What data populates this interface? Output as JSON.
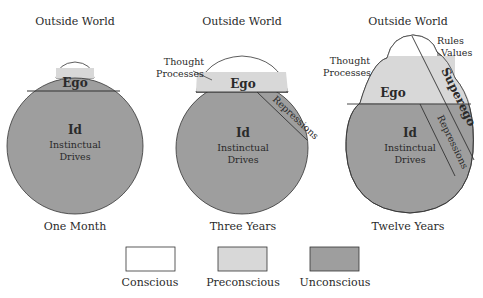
{
  "colors": {
    "conscious": "#ffffff",
    "preconscious": "#d8d8d8",
    "unconscious": "#9e9e9e",
    "stroke": "#333333"
  },
  "panels": [
    {
      "top_label": "Outside World",
      "caption": "One Month",
      "ego": "Ego",
      "id": "Id",
      "id_sub_1": "Instinctual",
      "id_sub_2": "Drives"
    },
    {
      "top_label": "Outside World",
      "caption": "Three Years",
      "ego": "Ego",
      "id": "Id",
      "id_sub_1": "Instinctual",
      "id_sub_2": "Drives",
      "thought_1": "Thought",
      "thought_2": "Processes",
      "repressions": "Repressions"
    },
    {
      "top_label": "Outside World",
      "caption": "Twelve Years",
      "ego": "Ego",
      "id": "Id",
      "id_sub_1": "Instinctual",
      "id_sub_2": "Drives",
      "thought_1": "Thought",
      "thought_2": "Processes",
      "repressions": "Repressions",
      "superego": "Superego",
      "rules": "Rules",
      "values": "Values"
    }
  ],
  "legend": [
    {
      "label": "Conscious"
    },
    {
      "label": "Preconscious"
    },
    {
      "label": "Unconscious"
    }
  ]
}
